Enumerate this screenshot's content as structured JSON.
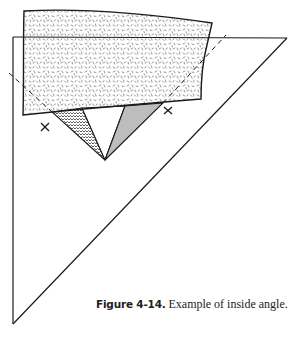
{
  "figure": {
    "caption_label": "Figure 4-14.",
    "caption_text": "Example of inside angle."
  },
  "diagram": {
    "elements": [
      "large-folded-triangle",
      "speckled-paper-rectangle",
      "hatched-wedge",
      "white-wedge",
      "gray-wedge",
      "dashed-fold-line",
      "x-mark-left",
      "x-mark-right"
    ],
    "colors": {
      "line": "#1a1a1a",
      "gray_wedge": "#bdbdbd",
      "speckle": "#6a6a6a",
      "background": "#ffffff"
    }
  }
}
